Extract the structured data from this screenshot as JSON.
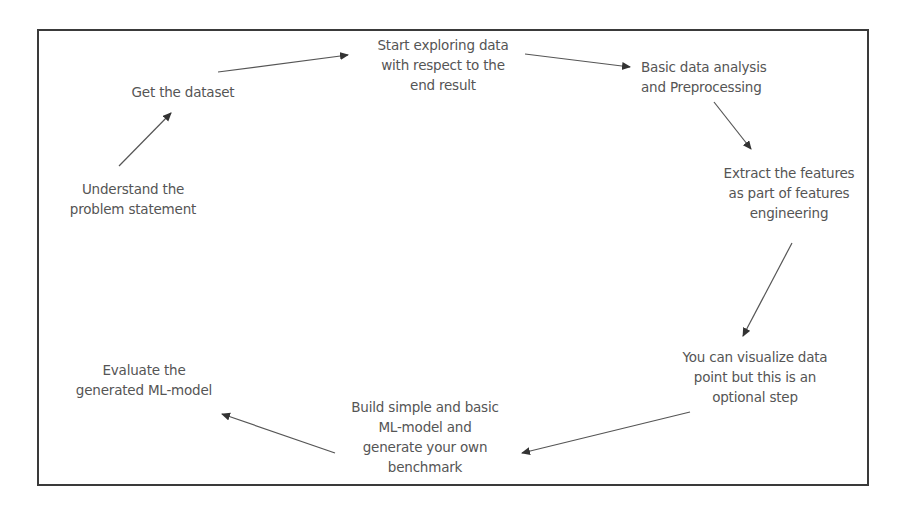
{
  "diagram": {
    "type": "cyclic-flow",
    "title": "",
    "colors": {
      "border": "#3a3a3a",
      "text": "#555555",
      "arrow": "#444444",
      "background": "#ffffff"
    },
    "nodes": [
      {
        "id": "understand",
        "lines": [
          "Understand the",
          "problem statement"
        ]
      },
      {
        "id": "dataset",
        "lines": [
          "Get the dataset"
        ]
      },
      {
        "id": "explore",
        "lines": [
          "Start exploring data",
          "with respect to the",
          "end result"
        ]
      },
      {
        "id": "preprocess",
        "lines": [
          "Basic data analysis",
          "and Preprocessing"
        ]
      },
      {
        "id": "features",
        "lines": [
          "Extract the features",
          "as part of features",
          "engineering"
        ]
      },
      {
        "id": "visualize",
        "lines": [
          "You can visualize data",
          "point but this is an",
          "optional step"
        ]
      },
      {
        "id": "build",
        "lines": [
          "Build simple and basic",
          "ML-model and",
          "generate your own",
          "benchmark"
        ]
      },
      {
        "id": "evaluate",
        "lines": [
          "Evaluate the",
          "generated ML-model"
        ]
      }
    ],
    "edges": [
      {
        "from": "understand",
        "to": "dataset"
      },
      {
        "from": "dataset",
        "to": "explore"
      },
      {
        "from": "explore",
        "to": "preprocess"
      },
      {
        "from": "preprocess",
        "to": "features"
      },
      {
        "from": "features",
        "to": "visualize"
      },
      {
        "from": "visualize",
        "to": "build"
      },
      {
        "from": "build",
        "to": "evaluate"
      }
    ]
  }
}
